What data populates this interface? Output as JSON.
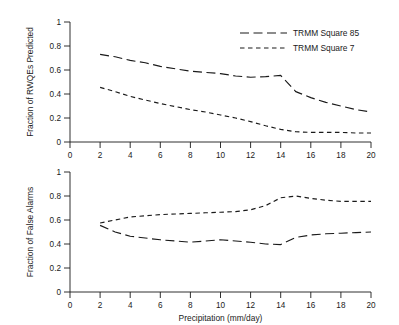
{
  "chart_data": [
    {
      "type": "line",
      "id": "top-panel",
      "title": "",
      "xlabel": "",
      "ylabel": "Fraction of RWQEs Predicted",
      "xlim": [
        0,
        20
      ],
      "ylim": [
        0,
        1
      ],
      "xticks": [
        0,
        2,
        4,
        6,
        8,
        10,
        12,
        14,
        16,
        18,
        20
      ],
      "yticks": [
        0,
        0.2,
        0.4,
        0.6,
        0.8,
        1
      ],
      "ytick_labels": [
        "0",
        "0.2",
        "0.4",
        "0.6",
        "0.8",
        "1"
      ],
      "grid": false,
      "legend_position": "top-right",
      "x": [
        2,
        3,
        4,
        5,
        6,
        7,
        8,
        9,
        10,
        11,
        12,
        13,
        14,
        15,
        16,
        17,
        18,
        19,
        20
      ],
      "series": [
        {
          "name": "TRMM Square 85",
          "style": "long-dash",
          "values": [
            0.73,
            0.71,
            0.68,
            0.66,
            0.63,
            0.61,
            0.59,
            0.58,
            0.57,
            0.55,
            0.54,
            0.545,
            0.555,
            0.42,
            0.37,
            0.33,
            0.3,
            0.27,
            0.25
          ]
        },
        {
          "name": "TRMM Square 7",
          "style": "short-dash",
          "values": [
            0.455,
            0.42,
            0.38,
            0.35,
            0.32,
            0.295,
            0.27,
            0.25,
            0.225,
            0.2,
            0.17,
            0.135,
            0.105,
            0.085,
            0.08,
            0.08,
            0.08,
            0.075,
            0.075
          ]
        }
      ]
    },
    {
      "type": "line",
      "id": "bottom-panel",
      "title": "",
      "xlabel": "Precipitation (mm/day)",
      "ylabel": "Fraction of False Alarms",
      "xlim": [
        0,
        20
      ],
      "ylim": [
        0,
        1
      ],
      "xticks": [
        0,
        2,
        4,
        6,
        8,
        10,
        12,
        14,
        16,
        18,
        20
      ],
      "yticks": [
        0,
        0.2,
        0.4,
        0.6,
        0.8,
        1
      ],
      "ytick_labels": [
        "0",
        "0.2",
        "0.4",
        "0.6",
        "0.8",
        "1"
      ],
      "grid": false,
      "legend_position": "none",
      "x": [
        2,
        3,
        4,
        5,
        6,
        7,
        8,
        9,
        10,
        11,
        12,
        13,
        14,
        15,
        16,
        17,
        18,
        19,
        20
      ],
      "series": [
        {
          "name": "TRMM Square 85",
          "style": "short-dash",
          "values": [
            0.575,
            0.6,
            0.625,
            0.635,
            0.645,
            0.65,
            0.655,
            0.66,
            0.665,
            0.67,
            0.685,
            0.72,
            0.785,
            0.8,
            0.78,
            0.765,
            0.755,
            0.755,
            0.755
          ]
        },
        {
          "name": "TRMM Square 7",
          "style": "long-dash",
          "values": [
            0.555,
            0.5,
            0.465,
            0.45,
            0.435,
            0.425,
            0.415,
            0.425,
            0.435,
            0.425,
            0.415,
            0.4,
            0.395,
            0.455,
            0.475,
            0.485,
            0.49,
            0.495,
            0.5
          ]
        }
      ]
    }
  ],
  "legend": {
    "items": [
      {
        "label": "TRMM Square 85",
        "style": "long-dash"
      },
      {
        "label": "TRMM Square 7",
        "style": "short-dash"
      }
    ]
  },
  "axes": {
    "top": {
      "ylabel": "Fraction of RWQEs Predicted",
      "ytick_labels": [
        "0",
        "0.2",
        "0.4",
        "0.6",
        "0.8",
        "1"
      ],
      "xtick_labels": [
        "0",
        "2",
        "4",
        "6",
        "8",
        "10",
        "12",
        "14",
        "16",
        "18",
        "20"
      ]
    },
    "bottom": {
      "ylabel": "Fraction of False Alarms",
      "xlabel": "Precipitation (mm/day)",
      "ytick_labels": [
        "0",
        "0.2",
        "0.4",
        "0.6",
        "0.8",
        "1"
      ],
      "xtick_labels": [
        "0",
        "2",
        "4",
        "6",
        "8",
        "10",
        "12",
        "14",
        "16",
        "18",
        "20"
      ]
    }
  }
}
